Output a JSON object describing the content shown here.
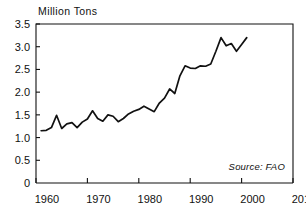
{
  "chart_data": {
    "type": "line",
    "title": "",
    "subtitle": "",
    "ylabel": "Million Tons",
    "xlabel": "",
    "xlim": [
      1960,
      2010
    ],
    "ylim": [
      0,
      3.5
    ],
    "grid": false,
    "legend": null,
    "annotations": [
      {
        "name": "source",
        "text": "Source: FAO",
        "position": "bottom-right",
        "style": "italic"
      }
    ],
    "yticks": [
      0,
      0.5,
      1.0,
      1.5,
      2.0,
      2.5,
      3.0,
      3.5
    ],
    "ytick_labels": [
      "0",
      "0.5",
      "1.0",
      "1.5",
      "2.0",
      "2.5",
      "3.0",
      "3.5"
    ],
    "xticks": [
      1960,
      1970,
      1980,
      1990,
      2000,
      2010
    ],
    "xtick_labels": [
      "1960",
      "1970",
      "1980",
      "1990",
      "2000",
      "2010"
    ],
    "series": [
      {
        "name": "Production",
        "x": [
          1961,
          1962,
          1963,
          1964,
          1965,
          1966,
          1967,
          1968,
          1969,
          1970,
          1971,
          1972,
          1973,
          1974,
          1975,
          1976,
          1977,
          1978,
          1979,
          1980,
          1981,
          1982,
          1983,
          1984,
          1985,
          1986,
          1987,
          1988,
          1989,
          1990,
          1991,
          1992,
          1993,
          1994,
          1995,
          1996,
          1997,
          1998,
          1999,
          2000,
          2001
        ],
        "values": [
          1.15,
          1.16,
          1.22,
          1.49,
          1.2,
          1.3,
          1.33,
          1.22,
          1.34,
          1.41,
          1.59,
          1.42,
          1.36,
          1.5,
          1.47,
          1.35,
          1.42,
          1.52,
          1.58,
          1.62,
          1.69,
          1.63,
          1.57,
          1.76,
          1.87,
          2.07,
          1.97,
          2.36,
          2.58,
          2.53,
          2.52,
          2.58,
          2.57,
          2.62,
          2.9,
          3.2,
          3.02,
          3.07,
          2.9,
          3.05,
          3.2
        ]
      }
    ]
  },
  "labels": {
    "y_axis_title": "Million Tons",
    "source": "Source: FAO"
  }
}
